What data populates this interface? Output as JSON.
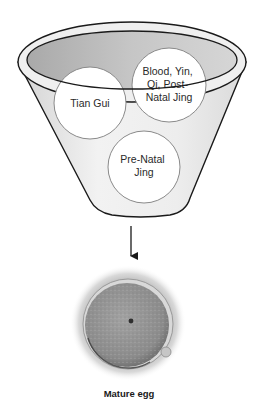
{
  "diagram": {
    "funnel_inputs": [
      {
        "id": "tian-gui",
        "lines": [
          "Tian Gui"
        ]
      },
      {
        "id": "blood-yin-qi",
        "lines": [
          "Blood, Yin,",
          "Qi, Post-",
          "Natal Jing"
        ]
      },
      {
        "id": "pre-natal-jing",
        "lines": [
          "Pre-Natal",
          "Jing"
        ]
      }
    ],
    "output": {
      "caption": "Mature egg"
    },
    "colors": {
      "outline": "#1a1a1a",
      "funnel_fill": "#e6e6e6",
      "funnel_interior": "#bdbdbd",
      "circle_fill": "#ffffff",
      "circle_stroke": "#8a8a8a",
      "egg_cell": "#8f8f8f",
      "egg_halo": "#c8c8c8"
    }
  }
}
